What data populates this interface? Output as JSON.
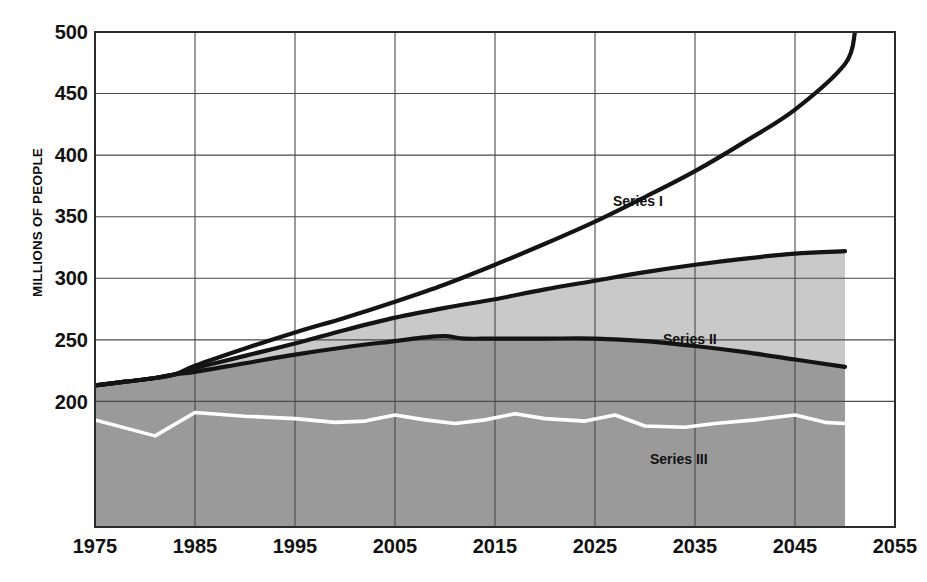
{
  "chart_data": {
    "type": "area",
    "title": "",
    "xlabel": "",
    "ylabel": "MILLIONS OF PEOPLE",
    "xlim": [
      1975,
      2055
    ],
    "ylim": [
      98,
      500
    ],
    "grid": true,
    "legend_position": "inline-annotations",
    "xticks": [
      1975,
      1985,
      1995,
      2005,
      2015,
      2025,
      2035,
      2045,
      2055
    ],
    "yticks": [
      200,
      250,
      300,
      350,
      400,
      450,
      500
    ],
    "xtick_labels": [
      "1975",
      "1985",
      "1995",
      "2005",
      "2015",
      "2025",
      "2035",
      "2045",
      "2055"
    ],
    "ytick_labels": [
      "200",
      "250",
      "300",
      "350",
      "400",
      "450",
      "500"
    ],
    "annotations": [
      {
        "text": "Series I",
        "x": 2026,
        "y": 369
      },
      {
        "text": "Series II",
        "x": 2031,
        "y": 277
      },
      {
        "text": "Series III",
        "x": 2030,
        "y": 214
      }
    ],
    "series": [
      {
        "name": "Series I",
        "color": "#1a1a1a",
        "style": "line",
        "x": [
          1975,
          1978,
          1981,
          1983,
          1985,
          1990,
          1995,
          2000,
          2005,
          2010,
          2015,
          2020,
          2025,
          2030,
          2035,
          2040,
          2045,
          2050,
          2051
        ],
        "values": [
          213,
          216,
          219,
          222,
          229,
          243,
          256,
          268,
          281,
          295,
          311,
          328,
          346,
          366,
          387,
          411,
          437,
          474,
          500
        ]
      },
      {
        "name": "Series II",
        "color": "#1a1a1a",
        "fill": "#c9c9c9",
        "style": "area",
        "x": [
          1975,
          1978,
          1981,
          1983,
          1985,
          1990,
          1995,
          2000,
          2005,
          2010,
          2015,
          2020,
          2025,
          2030,
          2035,
          2040,
          2045,
          2050
        ],
        "values": [
          213,
          216,
          219,
          222,
          227,
          237,
          247,
          258,
          268,
          276,
          283,
          291,
          298,
          305,
          311,
          316,
          320,
          322
        ]
      },
      {
        "name": "Series III",
        "color": "#1a1a1a",
        "fill": "#9a9a9a",
        "style": "area",
        "x": [
          1975,
          1978,
          1981,
          1983,
          1985,
          1990,
          1995,
          2000,
          2005,
          2008,
          2010,
          2012,
          2015,
          2020,
          2025,
          2030,
          2035,
          2040,
          2045,
          2050
        ],
        "values": [
          213,
          216,
          219,
          222,
          224,
          231,
          238,
          244,
          249,
          252,
          253,
          251,
          251,
          251,
          251,
          249,
          245,
          240,
          234,
          228
        ]
      },
      {
        "name": "Series III inner line",
        "color": "#ffffff",
        "style": "line",
        "x": [
          1975,
          1981,
          1985,
          1990,
          1995,
          1999,
          2002,
          2005,
          2008,
          2011,
          2014,
          2017,
          2020,
          2024,
          2027,
          2030,
          2034,
          2037,
          2041,
          2045,
          2048,
          2050
        ],
        "values": [
          185,
          172,
          191,
          188,
          186,
          183,
          184,
          189,
          185,
          182,
          185,
          190,
          186,
          184,
          189,
          180,
          179,
          182,
          185,
          189,
          183,
          182
        ]
      }
    ]
  },
  "axes": {
    "y_axis_title": "MILLIONS OF PEOPLE"
  }
}
